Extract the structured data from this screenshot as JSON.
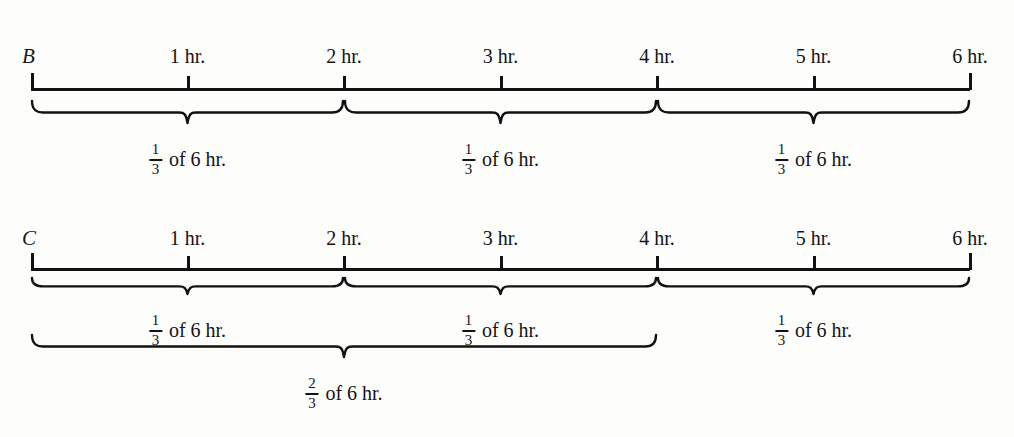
{
  "diagram": {
    "title_visible": false,
    "unit_label": "hr.",
    "ink_color": "#111111",
    "background_color": "#fdfdfc"
  },
  "rows": [
    {
      "id": "row-b",
      "label": "B",
      "axis": {
        "start_hour": 0,
        "end_hour": 6,
        "ticks": [
          {
            "hour": 1,
            "caption": "1 hr."
          },
          {
            "hour": 2,
            "caption": "2 hr."
          },
          {
            "hour": 3,
            "caption": "3 hr."
          },
          {
            "hour": 4,
            "caption": "4 hr."
          },
          {
            "hour": 5,
            "caption": "5 hr."
          },
          {
            "hour": 6,
            "caption": "6 hr."
          }
        ]
      },
      "braces": [
        {
          "from_hour": 0,
          "to_hour": 2,
          "numerator": "1",
          "denominator": "3",
          "text": "of 6 hr."
        },
        {
          "from_hour": 2,
          "to_hour": 4,
          "numerator": "1",
          "denominator": "3",
          "text": "of 6 hr."
        },
        {
          "from_hour": 4,
          "to_hour": 6,
          "numerator": "1",
          "denominator": "3",
          "text": "of 6 hr."
        }
      ]
    },
    {
      "id": "row-c",
      "label": "C",
      "axis": {
        "start_hour": 0,
        "end_hour": 6,
        "ticks": [
          {
            "hour": 1,
            "caption": "1 hr."
          },
          {
            "hour": 2,
            "caption": "2 hr."
          },
          {
            "hour": 3,
            "caption": "3 hr."
          },
          {
            "hour": 4,
            "caption": "4 hr."
          },
          {
            "hour": 5,
            "caption": "5 hr."
          },
          {
            "hour": 6,
            "caption": "6 hr."
          }
        ]
      },
      "braces": [
        {
          "from_hour": 0,
          "to_hour": 2,
          "numerator": "1",
          "denominator": "3",
          "text": "of 6 hr."
        },
        {
          "from_hour": 2,
          "to_hour": 4,
          "numerator": "1",
          "denominator": "3",
          "text": "of 6 hr."
        },
        {
          "from_hour": 4,
          "to_hour": 6,
          "numerator": "1",
          "denominator": "3",
          "text": "of 6 hr."
        }
      ],
      "lower_braces": [
        {
          "from_hour": 0,
          "to_hour": 4,
          "numerator": "2",
          "denominator": "3",
          "text": "of 6 hr."
        }
      ]
    }
  ]
}
